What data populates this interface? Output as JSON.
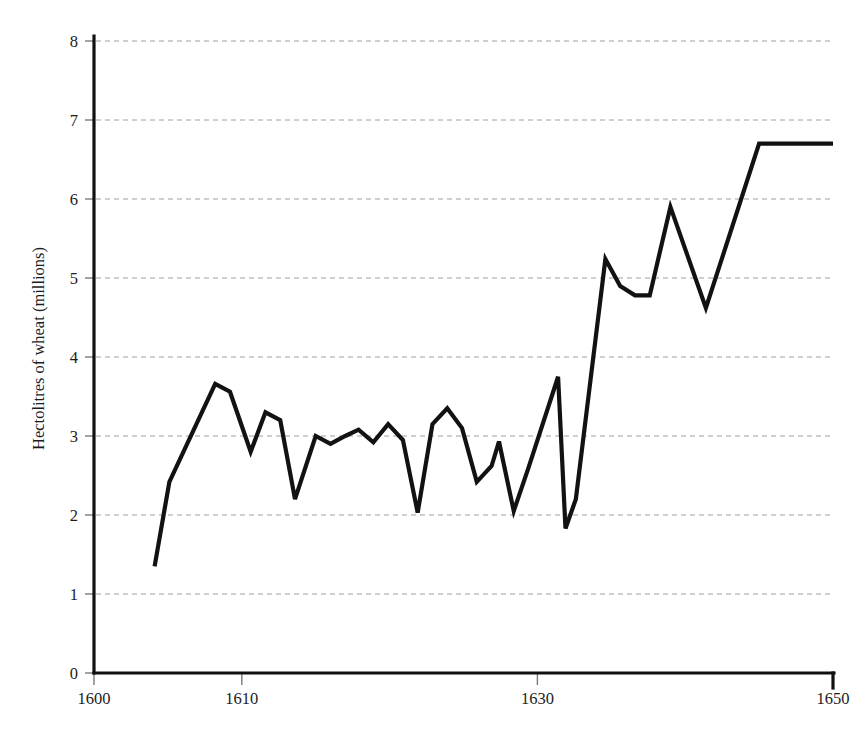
{
  "figure": {
    "background_color": "#ffffff",
    "line_color": "#121212",
    "grid_color": "#9a9a9a",
    "axis_color": "#111111",
    "caption_partial": "scanned page caption partially cropped"
  },
  "chart_data": {
    "type": "line",
    "title": "",
    "subtitle": "",
    "xlabel": "",
    "ylabel": "Hectolitres of wheat (millions)",
    "xlim": [
      1600,
      1650
    ],
    "ylim": [
      0,
      8
    ],
    "grid": true,
    "grid_axis": "y",
    "legend": false,
    "legend_position": "none",
    "x_ticks": [
      1600,
      1610,
      1630,
      1650
    ],
    "x_tick_labels": [
      "1600",
      "1610",
      "1630",
      "1650"
    ],
    "y_ticks": [
      0,
      1,
      2,
      3,
      4,
      5,
      6,
      7,
      8
    ],
    "y_tick_labels": [
      "0",
      "1",
      "2",
      "3",
      "4",
      "5",
      "6",
      "7",
      "8"
    ],
    "series": [
      {
        "name": "Hectolitres of wheat",
        "x": [
          1604,
          1605,
          1606,
          1607,
          1608,
          1609,
          1610,
          1611,
          1612,
          1613,
          1614,
          1615,
          1616,
          1617,
          1618,
          1619,
          1620,
          1621,
          1622,
          1623,
          1624,
          1625,
          1626,
          1627,
          1628,
          1629,
          1630,
          1631,
          1632,
          1633,
          1634,
          1635,
          1636,
          1637,
          1638,
          1639,
          1640,
          1641,
          1642,
          1643,
          1644,
          1645,
          1646,
          1647,
          1648,
          1649,
          1650
        ],
        "y": [
          1.35,
          2.42,
          3.66,
          3.56,
          2.8,
          3.3,
          3.2,
          2.2,
          3.0,
          2.92,
          3.0,
          3.08,
          2.92,
          3.15,
          2.95,
          2.03,
          3.15,
          3.35,
          3.1,
          2.42,
          2.62,
          2.93,
          2.05,
          2.6,
          3.75,
          1.83,
          2.2,
          5.24,
          4.9,
          4.78,
          4.78,
          5.4,
          5.9,
          5.3,
          4.62,
          5.62,
          6.7,
          6.7,
          6.7,
          6.7,
          6.7,
          6.7,
          6.7,
          6.7,
          6.7,
          6.7,
          6.7
        ]
      }
    ],
    "points": [
      {
        "x": 1604.1,
        "y": 1.35
      },
      {
        "x": 1605.1,
        "y": 2.42
      },
      {
        "x": 1608.2,
        "y": 3.66
      },
      {
        "x": 1609.2,
        "y": 3.56
      },
      {
        "x": 1610.6,
        "y": 2.8
      },
      {
        "x": 1611.6,
        "y": 3.3
      },
      {
        "x": 1612.6,
        "y": 3.2
      },
      {
        "x": 1613.6,
        "y": 2.2
      },
      {
        "x": 1615.0,
        "y": 3.0
      },
      {
        "x": 1616.0,
        "y": 2.9
      },
      {
        "x": 1617.0,
        "y": 3.0
      },
      {
        "x": 1617.9,
        "y": 3.08
      },
      {
        "x": 1618.9,
        "y": 2.92
      },
      {
        "x": 1619.9,
        "y": 3.15
      },
      {
        "x": 1620.9,
        "y": 2.95
      },
      {
        "x": 1621.9,
        "y": 2.03
      },
      {
        "x": 1622.9,
        "y": 3.15
      },
      {
        "x": 1623.9,
        "y": 3.35
      },
      {
        "x": 1624.9,
        "y": 3.1
      },
      {
        "x": 1625.9,
        "y": 2.42
      },
      {
        "x": 1626.9,
        "y": 2.62
      },
      {
        "x": 1627.4,
        "y": 2.93
      },
      {
        "x": 1628.4,
        "y": 2.05
      },
      {
        "x": 1629.4,
        "y": 2.6
      },
      {
        "x": 1631.4,
        "y": 3.75
      },
      {
        "x": 1631.9,
        "y": 1.83
      },
      {
        "x": 1632.6,
        "y": 2.2
      },
      {
        "x": 1634.6,
        "y": 5.24
      },
      {
        "x": 1635.6,
        "y": 4.9
      },
      {
        "x": 1636.6,
        "y": 4.78
      },
      {
        "x": 1637.6,
        "y": 4.78
      },
      {
        "x": 1639.0,
        "y": 5.9
      },
      {
        "x": 1641.4,
        "y": 4.62
      },
      {
        "x": 1645.0,
        "y": 6.7
      },
      {
        "x": 1650.0,
        "y": 6.7
      }
    ],
    "annotations": [],
    "notable_values": {
      "first_value": 1.35,
      "first_year": 1604,
      "last_value": 6.7,
      "last_year": 1650,
      "maximum": 6.7,
      "maximum_year": 1650,
      "minimum": 1.35,
      "minimum_year": 1604,
      "pre_1632_average": 2.9,
      "post_1634_average": 5.3
    }
  }
}
